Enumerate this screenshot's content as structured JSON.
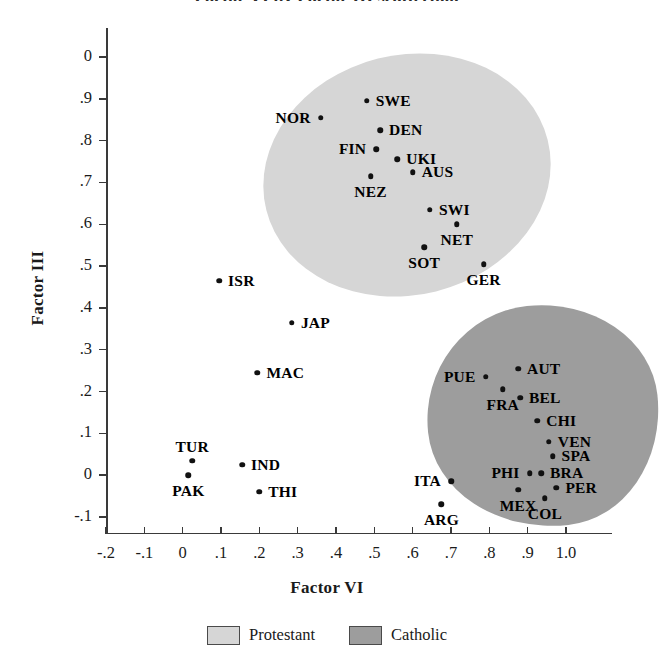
{
  "figure": {
    "clipped_title": "Factor VI by Factor III scatterplot"
  },
  "axes": {
    "x_title": "Factor VI",
    "y_title": "Factor III",
    "x_ticks": [
      "-.2",
      "-.1",
      "0",
      ".1",
      ".2",
      ".3",
      ".4",
      ".5",
      ".6",
      ".7",
      ".8",
      ".9",
      "1.0"
    ],
    "y_ticks": [
      "0",
      ".9",
      ".8",
      ".7",
      ".6",
      ".5",
      ".4",
      ".3",
      ".2",
      ".1",
      "0",
      "-.1"
    ]
  },
  "legend": {
    "items": [
      {
        "label": "Protestant",
        "color": "#d6d6d6"
      },
      {
        "label": "Catholic",
        "color": "#9d9d9d"
      }
    ]
  },
  "chart_data": {
    "type": "scatter",
    "title": "",
    "xlabel": "Factor VI",
    "ylabel": "Factor III",
    "xlim": [
      -0.2,
      1.0
    ],
    "ylim": [
      -0.1,
      1.0
    ],
    "grid": false,
    "legend_position": "bottom-center",
    "groups": [
      {
        "name": "Protestant",
        "color": "#d6d6d6",
        "points": [
          {
            "label": "NOR",
            "x": 0.36,
            "y": 0.855,
            "label_side": "left"
          },
          {
            "label": "SWE",
            "x": 0.48,
            "y": 0.895,
            "label_side": "right"
          },
          {
            "label": "DEN",
            "x": 0.515,
            "y": 0.825,
            "label_side": "right"
          },
          {
            "label": "FIN",
            "x": 0.505,
            "y": 0.78,
            "label_side": "left"
          },
          {
            "label": "UKI",
            "x": 0.56,
            "y": 0.755,
            "label_side": "right"
          },
          {
            "label": "AUS",
            "x": 0.6,
            "y": 0.725,
            "label_side": "right"
          },
          {
            "label": "NEZ",
            "x": 0.49,
            "y": 0.715,
            "label_side": "below"
          },
          {
            "label": "SWI",
            "x": 0.645,
            "y": 0.635,
            "label_side": "right"
          },
          {
            "label": "NET",
            "x": 0.715,
            "y": 0.6,
            "label_side": "below"
          },
          {
            "label": "SOT",
            "x": 0.63,
            "y": 0.545,
            "label_side": "below"
          },
          {
            "label": "GER",
            "x": 0.785,
            "y": 0.505,
            "label_side": "below"
          }
        ]
      },
      {
        "name": "Catholic",
        "color": "#9d9d9d",
        "points": [
          {
            "label": "AUT",
            "x": 0.875,
            "y": 0.255,
            "label_side": "right"
          },
          {
            "label": "PUE",
            "x": 0.79,
            "y": 0.235,
            "label_side": "left"
          },
          {
            "label": "FRA",
            "x": 0.835,
            "y": 0.205,
            "label_side": "below"
          },
          {
            "label": "BEL",
            "x": 0.88,
            "y": 0.185,
            "label_side": "right"
          },
          {
            "label": "CHI",
            "x": 0.925,
            "y": 0.13,
            "label_side": "right"
          },
          {
            "label": "VEN",
            "x": 0.955,
            "y": 0.08,
            "label_side": "right"
          },
          {
            "label": "SPA",
            "x": 0.965,
            "y": 0.045,
            "label_side": "right"
          },
          {
            "label": "PHI",
            "x": 0.905,
            "y": 0.005,
            "label_side": "left"
          },
          {
            "label": "BRA",
            "x": 0.935,
            "y": 0.005,
            "label_side": "right"
          },
          {
            "label": "ITA",
            "x": 0.7,
            "y": -0.015,
            "label_side": "left"
          },
          {
            "label": "PER",
            "x": 0.975,
            "y": -0.03,
            "label_side": "right"
          },
          {
            "label": "MEX",
            "x": 0.875,
            "y": -0.035,
            "label_side": "below"
          },
          {
            "label": "COL",
            "x": 0.945,
            "y": -0.055,
            "label_side": "below"
          },
          {
            "label": "ARG",
            "x": 0.675,
            "y": -0.07,
            "label_side": "below"
          }
        ]
      },
      {
        "name": "Unclustered",
        "color": "none",
        "points": [
          {
            "label": "ISR",
            "x": 0.095,
            "y": 0.465,
            "label_side": "right"
          },
          {
            "label": "JAP",
            "x": 0.285,
            "y": 0.365,
            "label_side": "right"
          },
          {
            "label": "MAC",
            "x": 0.195,
            "y": 0.245,
            "label_side": "right"
          },
          {
            "label": "TUR",
            "x": 0.025,
            "y": 0.035,
            "label_side": "above"
          },
          {
            "label": "IND",
            "x": 0.155,
            "y": 0.025,
            "label_side": "right"
          },
          {
            "label": "PAK",
            "x": 0.015,
            "y": 0.0,
            "label_side": "below"
          },
          {
            "label": "THI",
            "x": 0.2,
            "y": -0.04,
            "label_side": "right"
          }
        ]
      }
    ]
  }
}
